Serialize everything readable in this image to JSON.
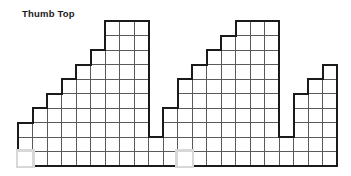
{
  "title": "Thumb Top",
  "colors": {
    "outline": "#1a1a1a",
    "gridline": "#5a5a5a",
    "highlight_stroke": "#d8d8d8",
    "highlight_fill": "#ffffff",
    "background": "#ffffff"
  },
  "chart_data": {
    "type": "bar",
    "title": "Thumb Top",
    "xlabel": "",
    "ylabel": "",
    "grid": true,
    "legend": null,
    "cell_px": 14.5,
    "origin_px": {
      "x": 18,
      "y": 166
    },
    "rows": 10,
    "columns": 22,
    "ylim": [
      0,
      10
    ],
    "categories": [
      "1",
      "2",
      "3",
      "4",
      "5",
      "6",
      "7",
      "8",
      "9",
      "10",
      "11",
      "12",
      "13",
      "14",
      "15",
      "16",
      "17",
      "18",
      "19",
      "20",
      "21",
      "22"
    ],
    "values": [
      3,
      4,
      5,
      6,
      7,
      8,
      10,
      10,
      10,
      2,
      4,
      6,
      7,
      8,
      9,
      10,
      10,
      10,
      2,
      5,
      6,
      7
    ],
    "series": [
      {
        "name": "column heights",
        "values": [
          3,
          4,
          5,
          6,
          7,
          8,
          10,
          10,
          10,
          2,
          4,
          6,
          7,
          8,
          9,
          10,
          10,
          10,
          2,
          5,
          6,
          7
        ]
      }
    ],
    "highlighted_cells": [
      {
        "col": 0,
        "row": 0
      },
      {
        "col": 11,
        "row": 0
      }
    ],
    "annotations": [
      {
        "text": "Thumb Top",
        "x": 22,
        "y": 8,
        "bold": true
      }
    ]
  }
}
